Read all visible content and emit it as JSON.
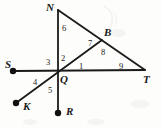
{
  "figure": {
    "width": 162,
    "height": 129,
    "background_color": "#fdfdfb",
    "stroke_color": "#1a1a1a",
    "label_color": "#1a1a1a"
  },
  "points": [
    {
      "id": "N",
      "label": "N",
      "x": 58,
      "y": 10,
      "label_x": 46,
      "label_y": 2,
      "marker": "none"
    },
    {
      "id": "B",
      "label": "B",
      "x": 102,
      "y": 40,
      "label_x": 104,
      "label_y": 27,
      "marker": "none"
    },
    {
      "id": "S",
      "label": "S",
      "x": 13,
      "y": 71,
      "label_x": 5,
      "label_y": 59,
      "marker": "dot"
    },
    {
      "id": "Q",
      "label": "Q",
      "x": 58,
      "y": 70,
      "label_x": 60,
      "label_y": 74,
      "marker": "none"
    },
    {
      "id": "T",
      "label": "T",
      "x": 145,
      "y": 70,
      "label_x": 143,
      "label_y": 74,
      "marker": "none"
    },
    {
      "id": "K",
      "label": "K",
      "x": 16,
      "y": 103,
      "label_x": 23,
      "label_y": 101,
      "marker": "dot"
    },
    {
      "id": "R",
      "label": "R",
      "x": 58,
      "y": 113,
      "label_x": 66,
      "label_y": 106,
      "marker": "dot"
    }
  ],
  "segments": [
    {
      "id": "N-Q-R",
      "from": "N",
      "to": "R",
      "description": "vertical line N through Q to R"
    },
    {
      "id": "S-Q-T",
      "from": "S",
      "to": "T",
      "description": "horizontal line S through Q to T"
    },
    {
      "id": "K-Q-B",
      "from": "K",
      "to": "B",
      "description": "ray from K through Q to B on NT"
    },
    {
      "id": "N-B-T",
      "from": "N",
      "to": "T",
      "description": "slanted line N to T passing through B"
    }
  ],
  "angles": [
    {
      "id": "a1",
      "label": "1",
      "x": 79,
      "y": 62,
      "vertex": "Q"
    },
    {
      "id": "a2",
      "label": "2",
      "x": 61,
      "y": 54,
      "vertex": "Q"
    },
    {
      "id": "a3",
      "label": "3",
      "x": 46,
      "y": 58,
      "vertex": "Q"
    },
    {
      "id": "a4",
      "label": "4",
      "x": 33,
      "y": 78,
      "vertex": "Q"
    },
    {
      "id": "a5",
      "label": "5",
      "x": 48,
      "y": 86,
      "vertex": "Q"
    },
    {
      "id": "a6",
      "label": "6",
      "x": 62,
      "y": 24,
      "vertex": "N"
    },
    {
      "id": "a7",
      "label": "7",
      "x": 88,
      "y": 39,
      "vertex": "B"
    },
    {
      "id": "a8",
      "label": "8",
      "x": 101,
      "y": 48,
      "vertex": "B"
    },
    {
      "id": "a9",
      "label": "9",
      "x": 119,
      "y": 62,
      "vertex": "T"
    }
  ]
}
